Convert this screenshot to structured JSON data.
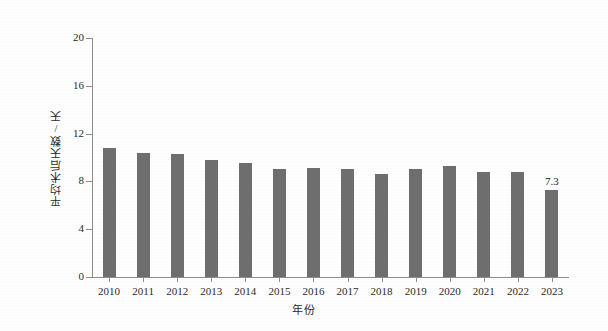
{
  "chart_data": {
    "type": "bar",
    "title": "",
    "xlabel": "年份",
    "ylabel": "平均术后天数/天",
    "categories": [
      "2010",
      "2011",
      "2012",
      "2013",
      "2014",
      "2015",
      "2016",
      "2017",
      "2018",
      "2019",
      "2020",
      "2021",
      "2022",
      "2023"
    ],
    "values": [
      10.8,
      10.4,
      10.3,
      9.8,
      9.5,
      9.0,
      9.1,
      9.0,
      8.6,
      9.0,
      9.3,
      8.8,
      8.8,
      7.3
    ],
    "point_labels": [
      "",
      "",
      "",
      "",
      "",
      "",
      "",
      "",
      "",
      "",
      "",
      "",
      "",
      "7.3"
    ],
    "ylim": [
      0,
      20
    ],
    "ytick_values": [
      0,
      4,
      8,
      12,
      16,
      20
    ],
    "ytick_labels": [
      "0",
      "4",
      "8",
      "12",
      "16",
      "20"
    ],
    "grid": false,
    "legend": null,
    "series_color": "#6e6e6e",
    "axis_color": "#8c8c8c",
    "background_color": "#fefefe"
  }
}
